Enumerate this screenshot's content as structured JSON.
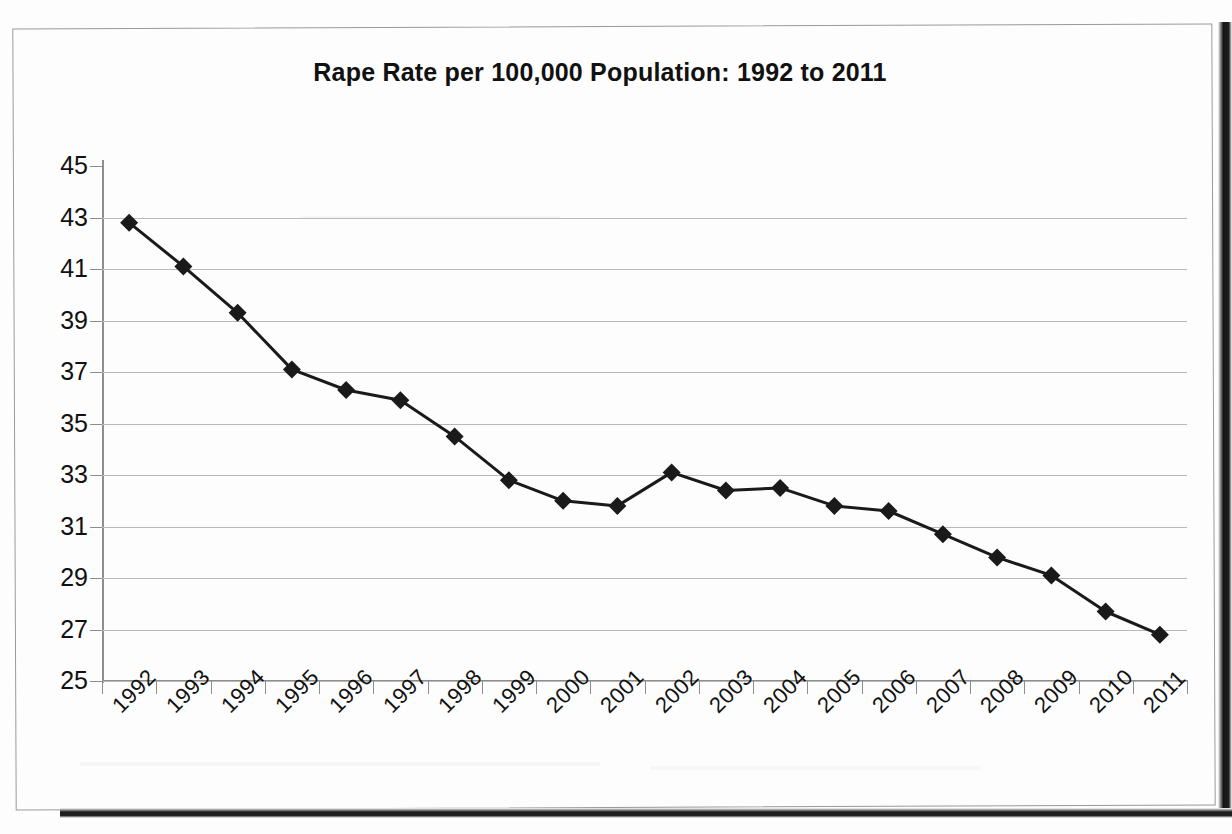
{
  "document": {
    "kind": "scanned-page",
    "frame_color": "#9a9a9a",
    "scan_edge_color": "#1a1a1a",
    "background": "#ffffff"
  },
  "chart_data": {
    "type": "line",
    "title": "Rape Rate per 100,000 Population: 1992 to 2011",
    "xlabel": "",
    "ylabel": "",
    "categories": [
      "1992",
      "1993",
      "1994",
      "1995",
      "1996",
      "1997",
      "1998",
      "1999",
      "2000",
      "2001",
      "2002",
      "2003",
      "2004",
      "2005",
      "2006",
      "2007",
      "2008",
      "2009",
      "2010",
      "2011"
    ],
    "values": [
      42.8,
      41.1,
      39.3,
      37.1,
      36.3,
      35.9,
      34.5,
      32.8,
      32.0,
      31.8,
      33.1,
      32.4,
      32.5,
      31.8,
      31.6,
      30.7,
      29.8,
      29.1,
      27.7,
      26.8
    ],
    "ylim": [
      25,
      45
    ],
    "ytick_step": 2,
    "ytick_labels": [
      "45",
      "43",
      "41",
      "39",
      "37",
      "35",
      "33",
      "31",
      "29",
      "27",
      "25"
    ],
    "grid": true,
    "grid_axis": "y",
    "legend": null,
    "legend_position": "none",
    "series_color": "#1a1a1a",
    "grid_color": "#b9b9b9",
    "axis_color": "#8d8d8d",
    "marker": "diamond",
    "marker_size": 9,
    "line_width": 3,
    "xtick_label_rotation": -45
  }
}
